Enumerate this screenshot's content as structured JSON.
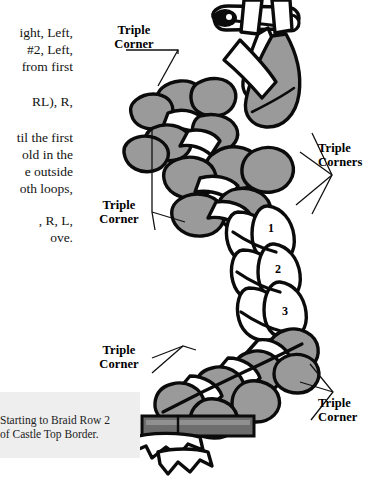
{
  "page": {
    "title": "Starting to Braid Row 2 of Castle Top Border",
    "background_color": "#ffffff",
    "ink_color": "#0b0b0b",
    "strand_grey": "#9a9a9a",
    "strand_white": "#ffffff",
    "caption_panel_color": "#eeeeee"
  },
  "instructions": {
    "block_a": {
      "line1": "ight, Left,",
      "line2": "#2, Left,",
      "line3": "from first"
    },
    "block_b": {
      "line1": "RL), R,"
    },
    "block_c": {
      "line1": "til the first",
      "line2": "old in the",
      "line3": "e outside",
      "line4": "oth loops,"
    },
    "block_d": {
      "line1": ", R, L,",
      "line2": "ove."
    }
  },
  "callouts": [
    {
      "name": "triple-corner-top",
      "line1": "Triple",
      "line2": "Corner"
    },
    {
      "name": "triple-corner-middle-left",
      "line1": "Triple",
      "line2": "Corner"
    },
    {
      "name": "triple-corners-right",
      "line1": "Triple",
      "line2": "Corners"
    },
    {
      "name": "triple-corner-bottom-left",
      "line1": "Triple",
      "line2": "Corner"
    },
    {
      "name": "triple-corner-bottom-right",
      "line1": "Triple",
      "line2": "Corner"
    }
  ],
  "strand_numbers": [
    {
      "label": "1",
      "x": 272,
      "y": 228
    },
    {
      "label": "2",
      "x": 279,
      "y": 269
    },
    {
      "label": "3",
      "x": 286,
      "y": 311
    }
  ],
  "caption": {
    "line1": "Starting to Braid Row 2",
    "line2": "of Castle Top Border."
  },
  "icons": {
    "safety_pin": "safety-pin-icon",
    "fringe_clip": "fringe-clip-icon"
  }
}
